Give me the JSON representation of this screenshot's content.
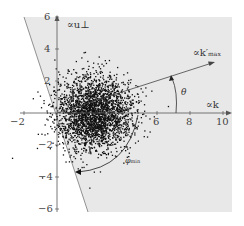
{
  "figure": {
    "y_axis_label": "∝u⊥",
    "x_axis_label": "∝k",
    "vector_label": "∝k′",
    "vector_label_sub": "max",
    "angle_theta_label": "θ",
    "angle_phi_label": "φ",
    "angle_phi_sub": "min",
    "x_ticks": [
      "−2",
      "6",
      "8",
      "10"
    ],
    "y_ticks": [
      "6",
      "4",
      "2",
      "−2",
      "−4",
      "−6"
    ],
    "colors": {
      "shaded_region": "#e6e6e6",
      "points": "#111111",
      "axis": "#555555",
      "boundary_line": "#777777"
    }
  },
  "chart_data": {
    "type": "scatter",
    "title": "",
    "xlabel": "∝k",
    "ylabel": "∝u⊥",
    "xlim": [
      -3,
      10
    ],
    "ylim": [
      -6,
      6
    ],
    "x_ticks": [
      -2,
      6,
      8,
      10
    ],
    "y_ticks": [
      6,
      4,
      2,
      -2,
      -4,
      -6
    ],
    "grid": false,
    "series": [
      {
        "name": "samples",
        "description": "dense 2D Gaussian-like point cloud",
        "center": [
          2.2,
          0.0
        ],
        "approx_radius": 2.8
      }
    ],
    "annotations": [
      {
        "type": "arrow",
        "label": "∝k′max",
        "from": [
          0,
          0
        ],
        "to": [
          10.7,
          3.7
        ]
      },
      {
        "type": "arc_arrow",
        "label": "θ",
        "description": "angle from ∝k axis to k′max"
      },
      {
        "type": "arc_arrow",
        "label": "φmin",
        "description": "angle from ∝k axis down to left boundary line"
      },
      {
        "type": "line",
        "label": "boundary",
        "from": [
          -2.6,
          5.2
        ],
        "to": [
          2.0,
          -6.0
        ],
        "description": "left edge of shaded admissible region"
      }
    ]
  }
}
